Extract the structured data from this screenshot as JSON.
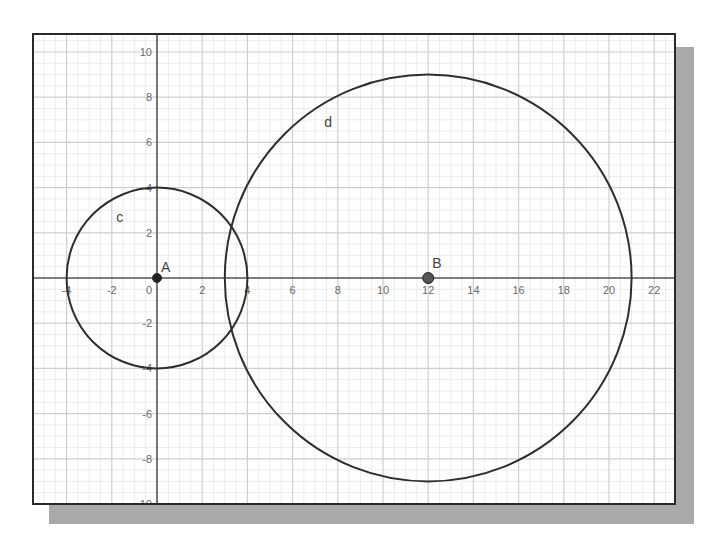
{
  "graph": {
    "x_ticks": [
      "-4",
      "-2",
      "0",
      "2",
      "4",
      "6",
      "8",
      "10",
      "12",
      "14",
      "16",
      "18",
      "20",
      "22"
    ],
    "y_ticks_pos": [
      "2",
      "4",
      "6",
      "8",
      "10"
    ],
    "y_ticks_neg": [
      "-2",
      "-4",
      "-6",
      "-8",
      "-10"
    ],
    "point_a_label": "A",
    "point_b_label": "B",
    "circle_c_label": "c",
    "circle_d_label": "d"
  },
  "colors": {
    "curve": "#2e2e2e",
    "axis": "#555555",
    "grid_major": "#cfcfcf",
    "grid_minor": "#ececec",
    "shadow": "#a9a9a9"
  },
  "chart_data": {
    "type": "scatter",
    "title": "",
    "xlabel": "",
    "ylabel": "",
    "xlim": [
      -5.4,
      23
    ],
    "ylim": [
      -10.2,
      10.8
    ],
    "grid": true,
    "x_tick_labels": [
      -4,
      -2,
      0,
      2,
      4,
      6,
      8,
      10,
      12,
      14,
      16,
      18,
      20,
      22
    ],
    "y_tick_labels": [
      -10,
      -8,
      -6,
      -4,
      -2,
      2,
      4,
      6,
      8,
      10
    ],
    "points": [
      {
        "name": "A",
        "x": 0,
        "y": 0
      },
      {
        "name": "B",
        "x": 12,
        "y": 0
      }
    ],
    "circles": [
      {
        "name": "c",
        "center": "A",
        "cx": 0,
        "cy": 0,
        "r": 4
      },
      {
        "name": "d",
        "center": "B",
        "cx": 12,
        "cy": 0,
        "r": 9
      }
    ],
    "annotations": [
      "A",
      "B",
      "c",
      "d"
    ]
  }
}
